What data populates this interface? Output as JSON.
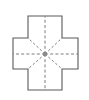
{
  "figure": {
    "shape_name": "greek-cross",
    "background_color": "#ffffff",
    "canvas": {
      "width": 89,
      "height": 100
    },
    "outline": {
      "stroke_color": "#5a5a5a",
      "fill_color": "#ffffff",
      "stroke_width": 1.1,
      "style": "solid",
      "points": "28,16 62,16 62,38 78,38 78,69 62,69 62,90 28,90 28,69 13,69 13,38 28,38",
      "bounds": {
        "left": 13,
        "top": 16,
        "right": 78,
        "bottom": 90
      },
      "arm_band": {
        "x_min": 28,
        "x_max": 62,
        "y_min": 38,
        "y_max": 69
      }
    },
    "center": {
      "x": 45,
      "y": 54,
      "radius": 2.2,
      "color": "#8a8a8a"
    },
    "radii": {
      "stroke_color": "#7d7d7d",
      "stroke_width": 1,
      "style": "dashed",
      "count": 8,
      "lines": [
        {
          "name": "up",
          "x1": 45,
          "y1": 54,
          "x2": 45,
          "y2": 16
        },
        {
          "name": "down",
          "x1": 45,
          "y1": 54,
          "x2": 45,
          "y2": 90
        },
        {
          "name": "left",
          "x1": 45,
          "y1": 54,
          "x2": 13,
          "y2": 54
        },
        {
          "name": "right",
          "x1": 45,
          "y1": 54,
          "x2": 78,
          "y2": 54
        },
        {
          "name": "up-left",
          "x1": 45,
          "y1": 54,
          "x2": 28,
          "y2": 38
        },
        {
          "name": "up-right",
          "x1": 45,
          "y1": 54,
          "x2": 62,
          "y2": 38
        },
        {
          "name": "down-left",
          "x1": 45,
          "y1": 54,
          "x2": 28,
          "y2": 69
        },
        {
          "name": "down-right",
          "x1": 45,
          "y1": 54,
          "x2": 62,
          "y2": 69
        }
      ]
    }
  }
}
